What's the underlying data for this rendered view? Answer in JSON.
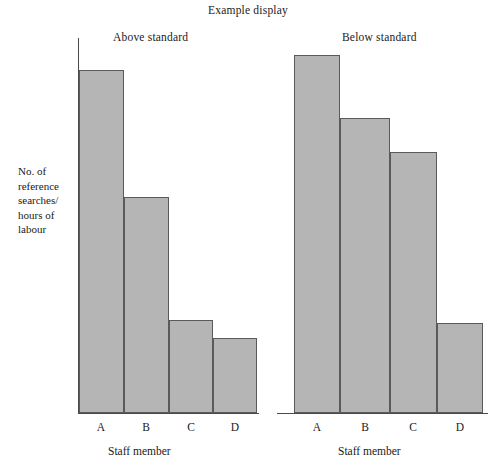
{
  "chart_data": {
    "type": "bar",
    "title": "Example display",
    "xlabel": "Staff member",
    "ylabel": "No. of reference searches/ hours of labour",
    "ylabel_lines": [
      "No. of",
      "reference",
      "searches/",
      "hours of",
      "labour"
    ],
    "categories": [
      "A",
      "B",
      "C",
      "D"
    ],
    "grid": false,
    "legend": "none",
    "ylim": [
      0,
      100
    ],
    "panels": [
      {
        "name": "above-standard",
        "heading": "Above standard",
        "xlabel": "Staff member",
        "categories": [
          "A",
          "B",
          "C",
          "D"
        ],
        "values": [
          92,
          58,
          25,
          20
        ]
      },
      {
        "name": "below-standard",
        "heading": "Below standard",
        "xlabel": "Staff member",
        "categories": [
          "A",
          "B",
          "C",
          "D"
        ],
        "values": [
          96,
          79,
          70,
          24
        ]
      }
    ],
    "series": [
      {
        "name": "Above standard",
        "values": [
          92,
          58,
          25,
          20
        ]
      },
      {
        "name": "Below standard",
        "values": [
          96,
          79,
          70,
          24
        ]
      }
    ],
    "colors": {
      "bar_fill": "#b5b5b5",
      "bar_stroke": "#5a5a5a",
      "axis": "#4a4a4a",
      "text": "#1a1a1a",
      "background": "#ffffff"
    }
  },
  "figure": {
    "title": "Example display",
    "left_panel": {
      "heading": "Above standard",
      "axis_caption": "Staff member",
      "ticks": [
        "A",
        "B",
        "C",
        "D"
      ]
    },
    "right_panel": {
      "heading": "Below standard",
      "axis_caption": "Staff member",
      "ticks": [
        "A",
        "B",
        "C",
        "D"
      ]
    },
    "y_axis_label_lines": [
      "No. of",
      "reference",
      "searches/",
      "hours of",
      "labour"
    ]
  }
}
